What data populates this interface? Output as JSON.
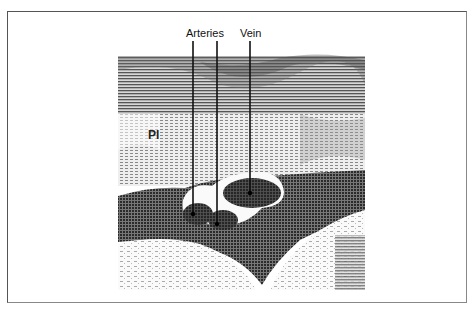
{
  "figure": {
    "type": "ultrasound-halftone-image",
    "labels": {
      "arteries": "Arteries",
      "vein": "Vein",
      "pl": "Pl"
    },
    "colors": {
      "frame": "#555555",
      "background": "#ffffff",
      "dark_tissue": "#3a3a3a",
      "mid_tissue": "#8a8a8a",
      "vessel": "#2e2e2e",
      "vessel_wall": "#ffffff"
    }
  }
}
